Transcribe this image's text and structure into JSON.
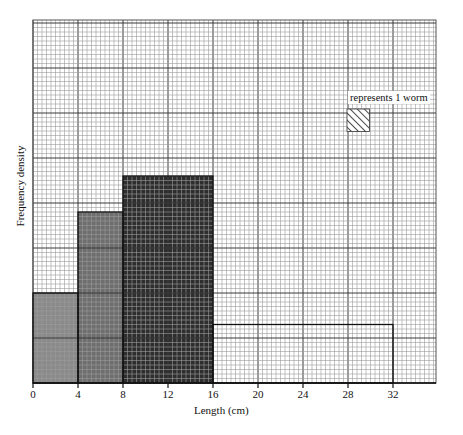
{
  "chart_data": {
    "type": "bar",
    "subtype": "histogram",
    "title": "",
    "xlabel": "Length (cm)",
    "ylabel": "Frequency density",
    "x_ticks": [
      0,
      4,
      8,
      12,
      16,
      20,
      24,
      28,
      32
    ],
    "xlim": [
      0,
      36
    ],
    "grid": true,
    "legend": {
      "text": "represents 1 worm",
      "symbol": "hatched square (5x5 small grid squares)",
      "position": "upper right"
    },
    "bins": [
      {
        "from": 0,
        "to": 4,
        "height_small_squares": 20,
        "frequency": 8,
        "fill": "#8a8a8a"
      },
      {
        "from": 4,
        "to": 8,
        "height_small_squares": 38,
        "frequency": 15,
        "fill": "#6e6e6e"
      },
      {
        "from": 8,
        "to": 16,
        "height_small_squares": 46,
        "frequency": 37,
        "fill": "#2e2e2e"
      },
      {
        "from": 16,
        "to": 32,
        "height_small_squares": 13,
        "frequency": 21,
        "fill": "none"
      }
    ],
    "categories": [
      "0-4",
      "4-8",
      "8-16",
      "16-32"
    ],
    "values": [
      8,
      15,
      37,
      21
    ]
  },
  "labels": {
    "xlabel": "Length (cm)",
    "ylabel": "Frequency density",
    "legend": "represents 1 worm",
    "ticks": [
      "0",
      "4",
      "8",
      "12",
      "16",
      "20",
      "24",
      "28",
      "32"
    ]
  },
  "colors": {
    "grid_minor": "#9a9a9a",
    "grid_major": "#3a3a3a",
    "axis": "#111111"
  }
}
